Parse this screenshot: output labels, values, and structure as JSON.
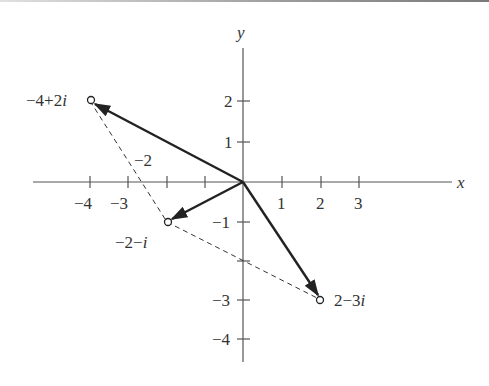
{
  "figure": {
    "axes": {
      "x_label": "x",
      "y_label": "y",
      "x_ticks": [
        {
          "value": -4,
          "label": "−4"
        },
        {
          "value": -3,
          "label": "−3"
        },
        {
          "value": -2,
          "label": "−2"
        },
        {
          "value": -1,
          "label": ""
        },
        {
          "value": 1,
          "label": "1"
        },
        {
          "value": 2,
          "label": "2"
        },
        {
          "value": 3,
          "label": "3"
        }
      ],
      "y_ticks": [
        {
          "value": 2,
          "label": "2"
        },
        {
          "value": 1,
          "label": "1"
        },
        {
          "value": -1,
          "label": "−1"
        },
        {
          "value": -2,
          "label": ""
        },
        {
          "value": -3,
          "label": "−3"
        },
        {
          "value": -4,
          "label": "−4"
        }
      ]
    },
    "points": [
      {
        "name": "sum",
        "re": -4,
        "im": 2,
        "label": "−4+2",
        "unit": "i"
      },
      {
        "name": "z1",
        "re": -2,
        "im": -1,
        "label": "−2−",
        "unit": "i"
      },
      {
        "name": "z2",
        "re": 2,
        "im": -3,
        "label": "2−3",
        "unit": "i"
      }
    ],
    "vectors": [
      {
        "from": [
          0,
          0
        ],
        "to": [
          -4,
          2
        ],
        "style": "solid-arrow"
      },
      {
        "from": [
          0,
          0
        ],
        "to": [
          -2,
          -1
        ],
        "style": "solid-arrow"
      },
      {
        "from": [
          0,
          0
        ],
        "to": [
          2,
          -3
        ],
        "style": "solid-arrow"
      }
    ],
    "dashed_segments": [
      {
        "from": [
          -4,
          2
        ],
        "to": [
          -2,
          -1
        ]
      },
      {
        "from": [
          -2,
          -1
        ],
        "to": [
          2,
          -3
        ]
      }
    ],
    "colors": {
      "ink": "#222222",
      "text": "#333333",
      "background": "#ffffff"
    }
  }
}
